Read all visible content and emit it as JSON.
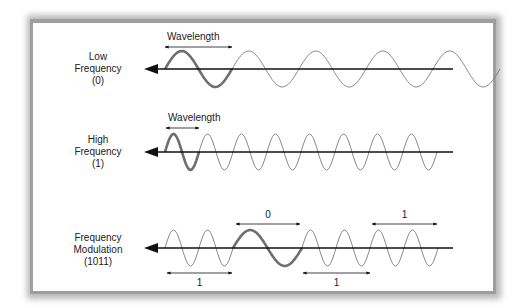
{
  "colors": {
    "axis": "#111111",
    "wave_thin": "#7a7a7a",
    "wave_highlight": "#6f6f6f",
    "text": "#222222",
    "frame": "#9e9e9e"
  },
  "rows": [
    {
      "id": "low-frequency",
      "label_lines": [
        "Low",
        "Frequency",
        "(0)"
      ],
      "axis_y": 69,
      "segments": [
        {
          "bit": "0",
          "cycles": 5,
          "wavelength": 67,
          "highlight_first": true
        }
      ],
      "annotations": [
        {
          "text": "Wavelength",
          "x1": 165,
          "x2": 232,
          "y": 47,
          "text_y": 40,
          "position": "above"
        }
      ]
    },
    {
      "id": "high-frequency",
      "label_lines": [
        "High",
        "Frequency",
        "(1)"
      ],
      "axis_y": 152,
      "segments": [
        {
          "bit": "1",
          "cycles": 8,
          "wavelength": 34,
          "highlight_first": true
        }
      ],
      "annotations": [
        {
          "text": "Wavelength",
          "x1": 166,
          "x2": 199,
          "y": 128,
          "text_y": 121,
          "position": "above"
        }
      ]
    },
    {
      "id": "frequency-modulation",
      "label_lines": [
        "Frequency",
        "Modulation",
        "(1011)"
      ],
      "axis_y": 248,
      "segments": [
        {
          "bit": "1",
          "cycles": 2,
          "wavelength": 34,
          "highlight_first": false
        },
        {
          "bit": "0",
          "cycles": 1,
          "wavelength": 69,
          "highlight_first": true
        },
        {
          "bit": "1",
          "cycles": 2,
          "wavelength": 34,
          "highlight_first": false
        },
        {
          "bit": "1",
          "cycles": 2,
          "wavelength": 34,
          "highlight_first": false
        }
      ],
      "annotations": [
        {
          "text": "1",
          "x1": 167,
          "x2": 232,
          "y": 273,
          "text_y": 286,
          "position": "below"
        },
        {
          "text": "0",
          "x1": 236,
          "x2": 300,
          "y": 224,
          "text_y": 218,
          "position": "above"
        },
        {
          "text": "1",
          "x1": 303,
          "x2": 370,
          "y": 273,
          "text_y": 286,
          "position": "below"
        },
        {
          "text": "1",
          "x1": 372,
          "x2": 437,
          "y": 224,
          "text_y": 218,
          "position": "above"
        }
      ]
    }
  ],
  "layout": {
    "wave_start_x": 165,
    "axis_start_x": 144,
    "axis_end_x": 453,
    "amplitude": 18,
    "label_center_x": 98
  }
}
